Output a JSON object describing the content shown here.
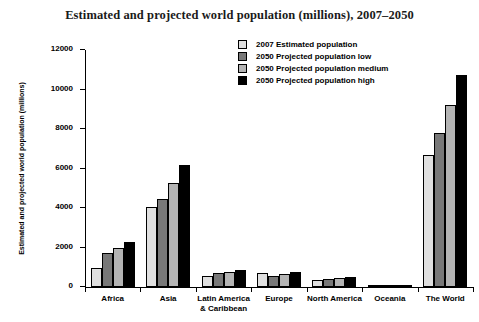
{
  "chart_data": {
    "type": "bar",
    "title": "Estimated and projected world population (millions), 2007–2050",
    "xlabel": "",
    "ylabel": "Estimated and projected world population (millions)",
    "ylim": [
      0,
      12000
    ],
    "yticks": [
      0,
      2000,
      4000,
      6000,
      8000,
      10000,
      12000
    ],
    "ytick_labels": [
      "0",
      "2000",
      "4000",
      "6000",
      "8000",
      "10000",
      "12000"
    ],
    "grid": false,
    "legend_position": "top-right",
    "categories": [
      "Africa",
      "Asia",
      "Latin America\n& Caribbean",
      "Europe",
      "North America",
      "Oceania",
      "The World"
    ],
    "category_lines": [
      [
        "Africa"
      ],
      [
        "Asia"
      ],
      [
        "Latin America",
        "& Caribbean"
      ],
      [
        "Europe"
      ],
      [
        "North America"
      ],
      [
        "Oceania"
      ],
      [
        "The World"
      ]
    ],
    "series": [
      {
        "name": "2007 Estimated population",
        "color": "#e0e0e0",
        "values": [
          965,
          4030,
          572,
          731,
          339,
          35,
          6671
        ]
      },
      {
        "name": "2050 Projected population low",
        "color": "#787878",
        "values": [
          1718,
          4444,
          691,
          566,
          398,
          44,
          7792
        ]
      },
      {
        "name": "2050 Projected population medium",
        "color": "#b4b4b4",
        "values": [
          1998,
          5266,
          769,
          664,
          445,
          49,
          9191
        ]
      },
      {
        "name": "2050 Projected population high",
        "color": "#000000",
        "values": [
          2302,
          6189,
          853,
          772,
          494,
          55,
          10756
        ]
      }
    ]
  },
  "legend": {
    "items": [
      {
        "label": "2007 Estimated population",
        "color": "#e0e0e0"
      },
      {
        "label": "2050 Projected population low",
        "color": "#787878"
      },
      {
        "label": "2050 Projected population medium",
        "color": "#b4b4b4"
      },
      {
        "label": "2050 Projected population high",
        "color": "#000000"
      }
    ]
  }
}
